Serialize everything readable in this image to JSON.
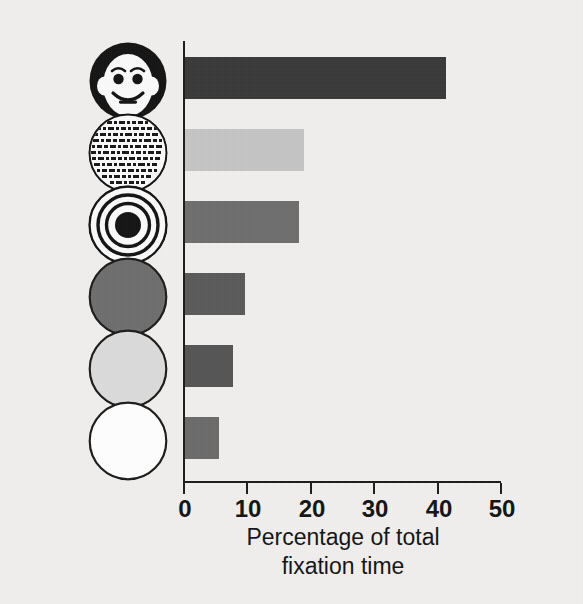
{
  "figure": {
    "background_color": "#f1f0ee",
    "axis_color": "#1c1c1c"
  },
  "chart_data": {
    "type": "bar",
    "orientation": "horizontal",
    "title": "",
    "xlabel_line1": "Percentage of total",
    "xlabel_line2": "fixation time",
    "ylabel": "",
    "xlim": [
      0,
      50
    ],
    "xticks": [
      0,
      10,
      20,
      30,
      40,
      50
    ],
    "xtick_labels": [
      "0",
      "10",
      "20",
      "30",
      "40",
      "50"
    ],
    "grid": false,
    "legend": "none",
    "categories": [
      "schematic-face",
      "newsprint",
      "bullseye",
      "plain-dark-disc",
      "plain-light-disc",
      "plain-white-disc"
    ],
    "values": [
      41.3,
      18.9,
      18.1,
      9.6,
      7.7,
      5.5
    ],
    "bar_colors": [
      "#3a3a3a",
      "#c5c5c5",
      "#6e6e6e",
      "#5a5a5a",
      "#555555",
      "#6b6b6b"
    ]
  },
  "ticks": [
    {
      "label": "0",
      "value": 0
    },
    {
      "label": "10",
      "value": 10
    },
    {
      "label": "20",
      "value": 20
    },
    {
      "label": "30",
      "value": 30
    },
    {
      "label": "40",
      "value": 40
    },
    {
      "label": "50",
      "value": 50
    }
  ],
  "bars": [
    {
      "name": "bar-schematic-face",
      "value": 41.3,
      "color": "#3a3a3a"
    },
    {
      "name": "bar-newsprint",
      "value": 18.9,
      "color": "#c5c5c5"
    },
    {
      "name": "bar-bullseye",
      "value": 18.1,
      "color": "#6e6e6e"
    },
    {
      "name": "bar-plain-dark-disc",
      "value": 9.6,
      "color": "#5a5a5a"
    },
    {
      "name": "bar-plain-light-disc",
      "value": 7.7,
      "color": "#555555"
    },
    {
      "name": "bar-plain-white-disc",
      "value": 5.5,
      "color": "#6b6b6b"
    }
  ],
  "stimuli": [
    {
      "icon": "schematic-face-icon",
      "description": "schematic face"
    },
    {
      "icon": "newsprint-icon",
      "description": "printed text"
    },
    {
      "icon": "bullseye-icon",
      "description": "concentric circles"
    },
    {
      "icon": "plain-dark-disc-icon",
      "description": "plain dark disc"
    },
    {
      "icon": "plain-light-disc-icon",
      "description": "plain light disc"
    },
    {
      "icon": "plain-white-disc-icon",
      "description": "plain white disc"
    }
  ]
}
